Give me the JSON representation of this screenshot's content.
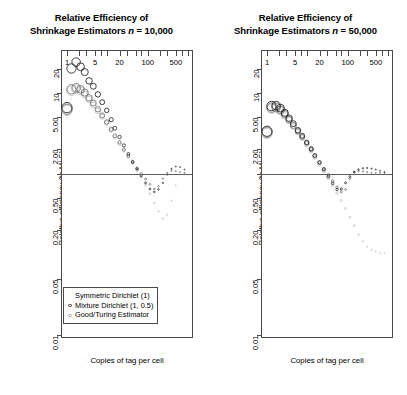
{
  "figure": {
    "y_axis_title": "Relative efficiency (to MLE)",
    "x_axis_title": "Copies of tag per cell",
    "y_ticks": [
      "20",
      "10",
      "5.00",
      "2.00",
      "0.50",
      "0.20",
      "0.05",
      "0.01"
    ],
    "x_ticks": [
      "1",
      "5",
      "20",
      "100",
      "500"
    ]
  },
  "panels": [
    {
      "title_line1": "Relative Efficiency of",
      "title_line2_pre": "Shrinkage Estimators ",
      "title_line2_ital": "n",
      "title_line2_post": " = 10,000",
      "n": "10,000",
      "y_axis_title": "Relative efficiency (to MLE)",
      "x_axis_title": "Copies of tag per cell",
      "has_legend": true
    },
    {
      "title_line1": "Relative Efficiency of",
      "title_line2_pre": "Shrinkage Estimators ",
      "title_line2_ital": "n",
      "title_line2_post": " = 50,000",
      "n": "50,000",
      "y_axis_title": "Relative efficiency (to MLE)",
      "x_axis_title": "Copies of tag per cell",
      "has_legend": false
    }
  ],
  "legend": {
    "entries": [
      {
        "label": "Symmetric Dirichlet (1)",
        "marker": "circle-open",
        "color": "#111111"
      },
      {
        "label": "Mixture Dirichlet (1, 0.5)",
        "marker": "circle-open",
        "color": "#555555"
      },
      {
        "label": "Good/Turing Estimator",
        "marker": "circle-open",
        "color": "#b0b0b0"
      }
    ]
  },
  "chart_data": {
    "type": "scatter",
    "title": "Relative Efficiency of Shrinkage Estimators",
    "xlabel": "Copies of tag per cell",
    "ylabel": "Relative efficiency (to MLE)",
    "xscale": "log",
    "yscale": "log",
    "xlim": [
      0.75,
      1400
    ],
    "ylim": [
      0.009,
      33
    ],
    "xticks": [
      1,
      5,
      20,
      100,
      500
    ],
    "xticklabels": [
      "1",
      "5",
      "20",
      "100",
      "500"
    ],
    "yticks": [
      20,
      10,
      5.0,
      2.0,
      0.5,
      0.2,
      0.05,
      0.01
    ],
    "yticklabels": [
      "20",
      "10",
      "5.00",
      "2.00",
      "0.50",
      "0.20",
      "0.05",
      "0.01"
    ],
    "grid": false,
    "hline": 1.0,
    "legend_position": "lower left",
    "panels": [
      {
        "name": "n = 10,000",
        "series": [
          {
            "name": "Symmetric Dirichlet (1)",
            "color": "#111111",
            "x": [
              1,
              1.3,
              1.7,
              2.2,
              2.8,
              3.6,
              4.6,
              6,
              7.7,
              10,
              13,
              16,
              21,
              27,
              35,
              45,
              58,
              74,
              95,
              122,
              157,
              201,
              259,
              332,
              426,
              547,
              702,
              900
            ],
            "y": [
              6.5,
              20,
              24,
              21,
              18,
              14,
              12,
              9.5,
              7.6,
              6.0,
              4.6,
              3.6,
              2.8,
              2.2,
              1.72,
              1.38,
              1.12,
              0.92,
              0.75,
              0.63,
              0.58,
              0.62,
              0.75,
              0.95,
              1.12,
              1.2,
              1.18,
              1.1
            ]
          },
          {
            "name": "Mixture Dirichlet (1, 0.5)",
            "color": "#666666",
            "x": [
              1,
              1.3,
              1.7,
              2.2,
              2.8,
              3.6,
              4.6,
              6,
              7.7,
              10,
              13,
              16,
              21,
              27,
              35,
              45,
              58,
              74,
              95,
              122,
              157,
              201,
              259,
              332,
              426,
              547,
              702,
              900
            ],
            "y": [
              6.2,
              11,
              11.5,
              11,
              10,
              8.6,
              7.4,
              6.2,
              5.2,
              4.3,
              3.5,
              2.9,
              2.4,
              1.95,
              1.62,
              1.35,
              1.14,
              0.98,
              0.84,
              0.72,
              0.63,
              0.68,
              0.85,
              1.0,
              1.06,
              1.05,
              1.02,
              1.0
            ]
          },
          {
            "name": "Good/Turing Estimator",
            "color": "#bdbdbd",
            "x": [
              1,
              1.3,
              1.7,
              2.2,
              2.8,
              3.6,
              4.6,
              6,
              7.7,
              10,
              13,
              16,
              21,
              27,
              35,
              45,
              58,
              74,
              95,
              122,
              157,
              201,
              259,
              332,
              426,
              547,
              702,
              900
            ],
            "y": [
              6.0,
              10.5,
              11,
              10.5,
              9.5,
              8.2,
              7.0,
              5.9,
              5.0,
              4.2,
              3.4,
              2.8,
              2.3,
              1.9,
              1.58,
              1.3,
              1.08,
              0.88,
              0.7,
              0.55,
              0.42,
              0.33,
              0.27,
              0.3,
              0.45,
              0.7,
              0.95,
              1.0
            ]
          }
        ]
      },
      {
        "name": "n = 50,000",
        "series": [
          {
            "name": "Symmetric Dirichlet (1)",
            "color": "#111111",
            "x": [
              1,
              1.3,
              1.7,
              2.2,
              2.8,
              3.6,
              4.6,
              6,
              7.7,
              10,
              13,
              16,
              21,
              27,
              35,
              45,
              58,
              74,
              95,
              122,
              157,
              201,
              259,
              332,
              426,
              547,
              702,
              900
            ],
            "y": [
              3.3,
              6.8,
              6.9,
              6.4,
              5.6,
              4.8,
              4.1,
              3.4,
              2.9,
              2.4,
              2.0,
              1.65,
              1.35,
              1.1,
              0.9,
              0.74,
              0.62,
              0.63,
              0.75,
              0.9,
              1.02,
              1.1,
              1.14,
              1.15,
              1.13,
              1.1,
              1.06,
              1.02
            ]
          },
          {
            "name": "Mixture Dirichlet (1, 0.5)",
            "color": "#666666",
            "x": [
              1,
              1.3,
              1.7,
              2.2,
              2.8,
              3.6,
              4.6,
              6,
              7.7,
              10,
              13,
              16,
              21,
              27,
              35,
              45,
              58,
              74,
              95,
              122,
              157,
              201,
              259,
              332,
              426,
              547,
              702,
              900
            ],
            "y": [
              3.2,
              6.5,
              6.6,
              6.1,
              5.4,
              4.6,
              3.9,
              3.3,
              2.8,
              2.35,
              1.95,
              1.62,
              1.34,
              1.12,
              0.94,
              0.79,
              0.66,
              0.58,
              0.62,
              0.85,
              1.02,
              1.05,
              1.04,
              1.02,
              1.0,
              1.0,
              1.0,
              1.0
            ]
          },
          {
            "name": "Good/Turing Estimator",
            "color": "#bdbdbd",
            "x": [
              1,
              1.3,
              1.7,
              2.2,
              2.8,
              3.6,
              4.6,
              6,
              7.7,
              10,
              13,
              16,
              21,
              27,
              35,
              45,
              58,
              74,
              95,
              122,
              157,
              201,
              259,
              332,
              426,
              547,
              702,
              900
            ],
            "y": [
              3.1,
              6.3,
              6.4,
              5.9,
              5.2,
              4.5,
              3.8,
              3.2,
              2.7,
              2.25,
              1.88,
              1.55,
              1.28,
              1.05,
              0.86,
              0.7,
              0.56,
              0.45,
              0.36,
              0.28,
              0.22,
              0.17,
              0.14,
              0.12,
              0.11,
              0.105,
              0.1,
              0.1
            ]
          }
        ]
      }
    ]
  }
}
